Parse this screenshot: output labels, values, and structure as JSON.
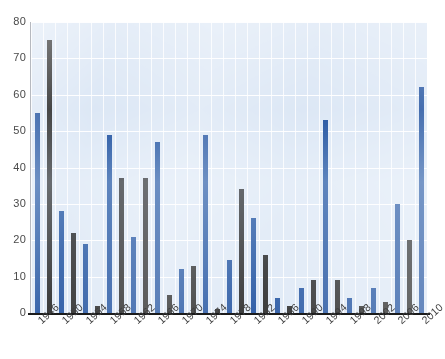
{
  "chart_data": {
    "type": "bar",
    "title": "",
    "subtitle": "",
    "xlabel": "",
    "ylabel": "",
    "ylim": [
      0,
      80
    ],
    "ytick_step": 10,
    "ytick_labels": [
      "0",
      "10",
      "20",
      "30",
      "40",
      "50",
      "60",
      "70",
      "80"
    ],
    "grid": true,
    "grid_color": "#ffffff",
    "plot_background": "#dce7f5",
    "legend": "none",
    "legend_position": "none",
    "x_tick_labels": [
      "1946",
      "1950",
      "1954",
      "1958",
      "1962",
      "1966",
      "1970",
      "1974",
      "1978",
      "1982",
      "1986",
      "1990",
      "1994",
      "1998",
      "2002",
      "2006",
      "2010"
    ],
    "x_tick_interval_years": 4,
    "bar_interval_years": 2,
    "colors": {
      "series_a": "#1d4f9e",
      "series_b": "#232323",
      "axis": "#1b1b1b",
      "tick_text": "#4a4a4a"
    },
    "categories": [
      "1946",
      "1948",
      "1950",
      "1952",
      "1954",
      "1956",
      "1958",
      "1960",
      "1962",
      "1964",
      "1966",
      "1968",
      "1970",
      "1972",
      "1974",
      "1976",
      "1978",
      "1980",
      "1982",
      "1984",
      "1986",
      "1988",
      "1990",
      "1992",
      "1994",
      "1996",
      "1998",
      "2000",
      "2002",
      "2004",
      "2006",
      "2008",
      "2010"
    ],
    "values": [
      55,
      75,
      28,
      22,
      19,
      2,
      49,
      37,
      21,
      37,
      47,
      5,
      12,
      13,
      49,
      1,
      14.5,
      34,
      26,
      16,
      4,
      2,
      7,
      9,
      53,
      9,
      4,
      2,
      7,
      3,
      30,
      20,
      62
    ],
    "bar_series": [
      "a",
      "b",
      "a",
      "b",
      "a",
      "b",
      "a",
      "b",
      "a",
      "b",
      "a",
      "b",
      "a",
      "b",
      "a",
      "b",
      "a",
      "b",
      "a",
      "b",
      "a",
      "b",
      "a",
      "b",
      "a",
      "b",
      "a",
      "b",
      "a",
      "b",
      "a",
      "b",
      "a"
    ]
  }
}
